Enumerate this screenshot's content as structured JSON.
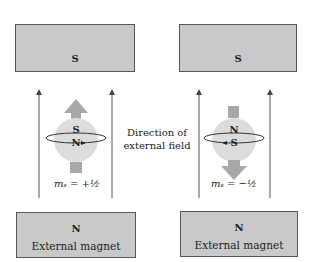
{
  "left": {
    "top_magnet": {
      "pole": "S"
    },
    "bottom_magnet": {
      "pole": "N",
      "label": "External magnet"
    },
    "electron": {
      "top_pole": "S",
      "bottom_pole": "N",
      "moment_arrow": "up"
    },
    "spin_label": "mₛ = +½"
  },
  "right": {
    "top_magnet": {
      "pole": "S"
    },
    "bottom_magnet": {
      "pole": "N",
      "label": "External magnet"
    },
    "electron": {
      "top_pole": "N",
      "bottom_pole": "S",
      "moment_arrow": "down"
    },
    "spin_label": "mₛ = −½"
  },
  "center_caption": {
    "line1": "Direction of",
    "line2": "external field"
  },
  "colors": {
    "magnet": "#c9c9c9",
    "sphere": "#dcdcdc",
    "arrow": "#a8a8a8",
    "line": "#444444"
  }
}
